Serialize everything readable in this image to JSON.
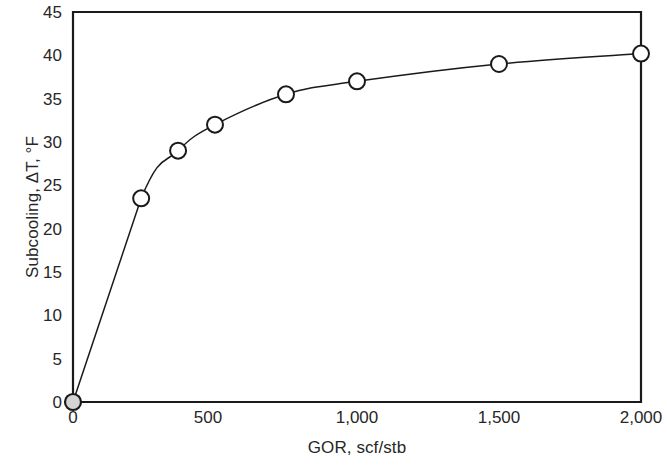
{
  "chart_data": {
    "type": "line",
    "title": "",
    "xlabel": "GOR, scf/stb",
    "ylabel": "Subcooling, ΔT, °F",
    "xlim": [
      0,
      2000
    ],
    "ylim": [
      0,
      45
    ],
    "xticks": [
      0,
      500,
      1000,
      1500,
      2000
    ],
    "xtick_labels": [
      "0",
      "500",
      "1,000",
      "1,500",
      "2,000"
    ],
    "yticks": [
      0,
      5,
      10,
      15,
      20,
      25,
      30,
      35,
      40,
      45
    ],
    "ytick_labels": [
      "0",
      "5",
      "10",
      "15",
      "20",
      "25",
      "30",
      "35",
      "40",
      "45"
    ],
    "grid": false,
    "legend": null,
    "series": [
      {
        "name": "Subcooling vs GOR",
        "marker": "circle-open",
        "line_color": "#1a1a1a",
        "marker_fill": "#ffffff",
        "marker_edge": "#1a1a1a",
        "x": [
          0,
          240,
          370,
          500,
          750,
          1000,
          1500,
          2000
        ],
        "values": [
          0,
          23.5,
          29.0,
          32.0,
          35.5,
          37.0,
          39.0,
          40.2
        ]
      }
    ],
    "highlight_point": {
      "name": "origin-point",
      "x": 0,
      "y": 0,
      "marker": "circle-filled",
      "fill": "#d4d4d4",
      "edge": "#1a1a1a"
    }
  },
  "axes": {
    "frame_color": "#1a1a1a",
    "background": "#ffffff"
  }
}
